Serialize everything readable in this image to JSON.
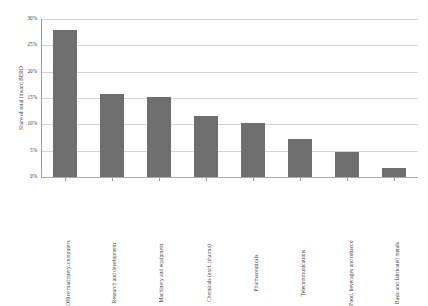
{
  "chart_data": {
    "type": "bar",
    "title": "",
    "subtitle": "",
    "xlabel": "",
    "ylabel": "Share of total inward BERD",
    "ylim": [
      0,
      30
    ],
    "yunit": "%",
    "grid": true,
    "legend": null,
    "bar_color": "#6e6e6e",
    "gridline_color": "#d4d4d4",
    "axis_color": "#9a9a9a",
    "categories": [
      "Office machinery, computers",
      "Research and development",
      "Machinery and equipment",
      "Chemicals (excl. pharma)",
      "Pharmaceuticals",
      "Telecommunications",
      "Food, beverages and tobacco",
      "Basic and fabricated metals"
    ],
    "values": [
      28.0,
      15.8,
      15.1,
      11.6,
      10.3,
      7.2,
      4.8,
      1.7
    ],
    "ytick_labels": [
      "30%",
      "25%",
      "20%",
      "15%",
      "10%",
      "5%",
      "0%"
    ],
    "ytick_values": [
      30,
      25,
      20,
      15,
      10,
      5,
      0
    ]
  }
}
